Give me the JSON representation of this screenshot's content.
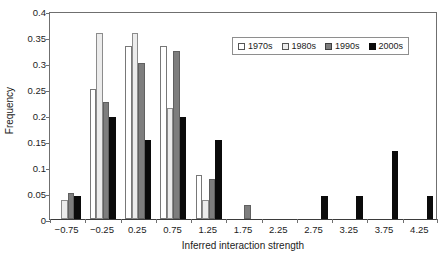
{
  "chart_data": {
    "type": "bar",
    "title": "",
    "xlabel": "Inferred interaction strength",
    "ylabel": "Frequency",
    "grid": false,
    "legend_position": "top-right",
    "ylim": [
      0,
      0.4
    ],
    "ytick_labels": [
      "0",
      "0.05",
      "0.1",
      "0.15",
      "0.2",
      "0.25",
      "0.3",
      "0.35",
      "0.4"
    ],
    "ytick_values": [
      0,
      0.05,
      0.1,
      0.15,
      0.2,
      0.25,
      0.3,
      0.35,
      0.4
    ],
    "categories": [
      "-0.75",
      "-0.25",
      "0.25",
      "0.75",
      "1.25",
      "1.75",
      "2.25",
      "2.75",
      "3.25",
      "3.75",
      "4.25"
    ],
    "series": [
      {
        "name": "1970s",
        "color": "#ffffff",
        "values": [
          0,
          0.25,
          0.333,
          0.333,
          0.085,
          0,
          0,
          0,
          0,
          0,
          0
        ]
      },
      {
        "name": "1980s",
        "color": "#ececec",
        "values": [
          0.036,
          0.357,
          0.357,
          0.214,
          0.036,
          0,
          0,
          0,
          0,
          0,
          0
        ]
      },
      {
        "name": "1990s",
        "color": "#7e7e7e",
        "values": [
          0.05,
          0.225,
          0.3,
          0.324,
          0.076,
          0.026,
          0,
          0,
          0,
          0,
          0
        ]
      },
      {
        "name": "2000s",
        "color": "#0b0b0b",
        "values": [
          0.044,
          0.196,
          0.152,
          0.196,
          0.152,
          0,
          0,
          0.044,
          0.044,
          0.13,
          0.044
        ]
      }
    ]
  },
  "legend": {
    "entries": [
      {
        "label": "1970s"
      },
      {
        "label": "1980s"
      },
      {
        "label": "1990s"
      },
      {
        "label": "2000s"
      }
    ]
  }
}
